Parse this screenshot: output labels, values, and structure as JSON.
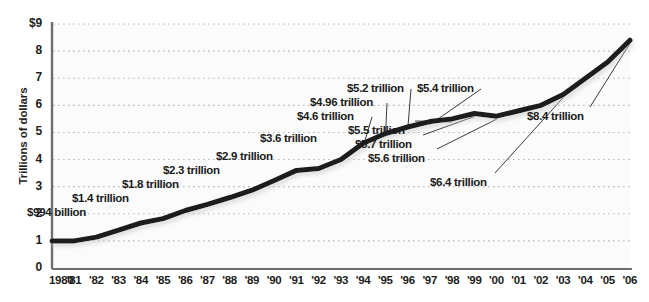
{
  "chart_data": {
    "type": "line",
    "title": "",
    "xlabel": "",
    "ylabel": "Trillions of dollars",
    "ylim": [
      0,
      9
    ],
    "xlim": [
      1980,
      2006
    ],
    "grid": true,
    "legend": "none",
    "y_ticks": [
      "$9",
      "8",
      "7",
      "6",
      "5",
      "4",
      "3",
      "2",
      "1",
      "0"
    ],
    "y_tick_values": [
      9,
      8,
      7,
      6,
      5,
      4,
      3,
      2,
      1,
      0
    ],
    "x_ticks": [
      "1980",
      "'81",
      "'82",
      "'83",
      "'84",
      "'85",
      "'86",
      "'87",
      "'88",
      "'89",
      "'90",
      "'91",
      "'92",
      "'93",
      "'94",
      "'95",
      "'96",
      "'97",
      "'98",
      "'99",
      "'00",
      "'01",
      "'02",
      "'03",
      "'04",
      "'05",
      "'06"
    ],
    "x": [
      1980,
      1981,
      1982,
      1983,
      1984,
      1985,
      1986,
      1987,
      1988,
      1989,
      1990,
      1991,
      1992,
      1993,
      1994,
      1995,
      1996,
      1997,
      1998,
      1999,
      2000,
      2001,
      2002,
      2003,
      2004,
      2005,
      2006
    ],
    "values": [
      0.994,
      1.0,
      1.14,
      1.4,
      1.66,
      1.82,
      2.12,
      2.35,
      2.6,
      2.87,
      3.23,
      3.6,
      3.67,
      4.0,
      4.6,
      4.96,
      5.2,
      5.4,
      5.5,
      5.7,
      5.6,
      5.8,
      6.0,
      6.4,
      7.0,
      7.6,
      8.4
    ],
    "line_color": "#1c1c1c",
    "line_width": 5,
    "annotations": [
      {
        "label": "$994 billion",
        "year": 1980,
        "value": 0.994
      },
      {
        "label": "$1.4 trillion",
        "year": 1983,
        "value": 1.4
      },
      {
        "label": "$1.8 trillion",
        "year": 1985,
        "value": 1.82
      },
      {
        "label": "$2.3 trillion",
        "year": 1987,
        "value": 2.35
      },
      {
        "label": "$2.9 trillion",
        "year": 1989,
        "value": 2.87
      },
      {
        "label": "$3.6 trillion",
        "year": 1991,
        "value": 3.6
      },
      {
        "label": "$4.6 trillion",
        "year": 1994,
        "value": 4.6
      },
      {
        "label": "$4.96 trillion",
        "year": 1995,
        "value": 4.96
      },
      {
        "label": "$5.2 trillion",
        "year": 1996,
        "value": 5.2
      },
      {
        "label": "$5.4 trillion",
        "year": 1997,
        "value": 5.4
      },
      {
        "label": "$5.5 trillion",
        "year": 1998,
        "value": 5.5
      },
      {
        "label": "$5.7 trillion",
        "year": 1999,
        "value": 5.7
      },
      {
        "label": "$5.6 trillion",
        "year": 2000,
        "value": 5.6
      },
      {
        "label": "$6.4 trillion",
        "year": 2003,
        "value": 6.4
      },
      {
        "label": "$8.4 trillion",
        "year": 2006,
        "value": 8.4
      }
    ]
  },
  "axis": {
    "y_title": "Trillions of dollars"
  },
  "colors": {
    "line": "#1c1c1c",
    "grid": "#b9b9b9",
    "axis": "#6e6e6e",
    "plot_bg": "#fbfbfb",
    "text": "#1c1c1c"
  }
}
